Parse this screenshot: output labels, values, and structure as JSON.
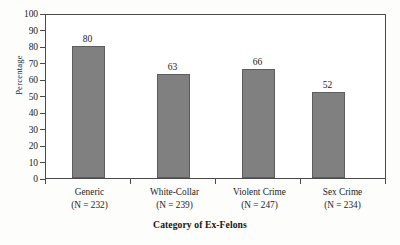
{
  "chart_data": {
    "type": "bar",
    "title": "",
    "categories": [
      "Generic",
      "White-Collar",
      "Violent Crime",
      "Sex Crime"
    ],
    "category_sublabels": [
      "(N = 232)",
      "(N = 239)",
      "(N = 247)",
      "(N = 234)"
    ],
    "values": [
      80,
      63,
      66,
      52
    ],
    "data_labels": [
      "80",
      "63",
      "66",
      "52"
    ],
    "xlabel": "Category of Ex-Felons",
    "ylabel": "Percentage",
    "ylim": [
      0,
      100
    ],
    "yticks": [
      0,
      10,
      20,
      30,
      40,
      50,
      60,
      70,
      80,
      90,
      100
    ],
    "ytick_labels": [
      "0",
      "10",
      "20",
      "30",
      "40",
      "50",
      "60",
      "70",
      "80",
      "90",
      "100"
    ],
    "grid": false,
    "legend": null,
    "bar_color": "#808080",
    "bar_edge_color": "#5d5d5d",
    "axis_color": "#4a4a4a",
    "text_color": "#1c1c1c",
    "background": "#ffffff"
  }
}
